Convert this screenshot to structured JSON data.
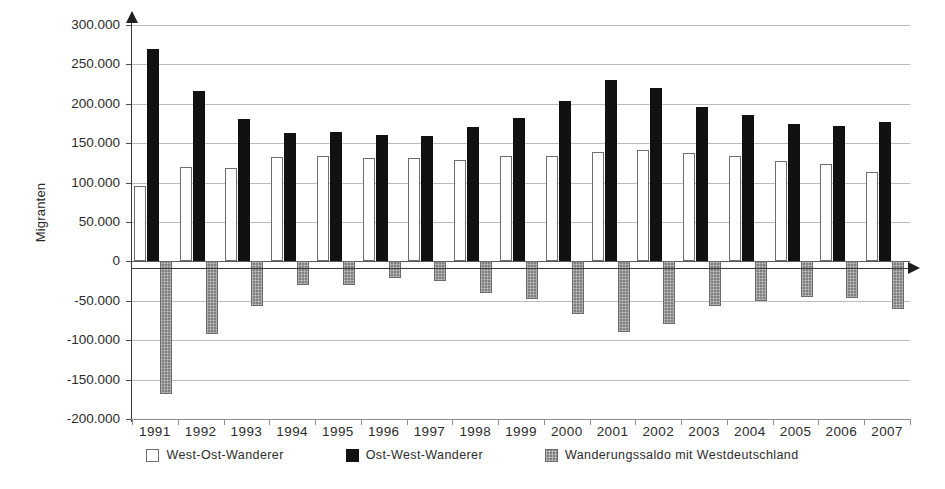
{
  "chart_data": {
    "type": "bar",
    "title": "",
    "xlabel": "",
    "ylabel": "Migranten",
    "ylim": [
      -200000,
      300000
    ],
    "ytick_step": 50000,
    "grid": true,
    "legend_position": "bottom",
    "categories": [
      "1991",
      "1992",
      "1993",
      "1994",
      "1995",
      "1996",
      "1997",
      "1998",
      "1999",
      "2000",
      "2001",
      "2002",
      "2003",
      "2004",
      "2005",
      "2006",
      "2007"
    ],
    "ytick_labels": [
      "300.000",
      "250.000",
      "200.000",
      "150.000",
      "100.000",
      "50.000",
      "0",
      "-50.000",
      "-100.000",
      "-150.000",
      "-200.000"
    ],
    "ytick_values": [
      300000,
      250000,
      200000,
      150000,
      100000,
      50000,
      0,
      -50000,
      -100000,
      -150000,
      -200000
    ],
    "series": [
      {
        "name": "West-Ost-Wanderer",
        "color": "#ffffff",
        "edge_color": "#6e6e6e",
        "values": [
          96000,
          120000,
          119000,
          133000,
          134000,
          131000,
          131000,
          129000,
          134000,
          134000,
          139000,
          141000,
          138000,
          134000,
          127000,
          124000,
          114000
        ]
      },
      {
        "name": "Ost-West-Wanderer",
        "color": "#111111",
        "edge_color": "#111111",
        "values": [
          270000,
          216000,
          181000,
          163000,
          164000,
          160000,
          159000,
          171000,
          182000,
          204000,
          230000,
          220000,
          196000,
          186000,
          174000,
          172000,
          177000
        ]
      },
      {
        "name": "Wanderungssaldo mit Westdeutschland",
        "color": "#808080",
        "edge_color": "#6a6a6a",
        "values": [
          -168000,
          -92000,
          -57000,
          -30000,
          -30000,
          -21000,
          -25000,
          -40000,
          -48000,
          -67000,
          -89000,
          -79000,
          -56000,
          -50000,
          -45000,
          -47000,
          -61000
        ]
      }
    ]
  },
  "axis": {
    "y_title": "Migranten"
  },
  "legend": {
    "items": [
      {
        "label": "West-Ost-Wanderer",
        "swatch": "west-ost"
      },
      {
        "label": "Ost-West-Wanderer",
        "swatch": "ost-west"
      },
      {
        "label": "Wanderungssaldo mit Westdeutschland",
        "swatch": "saldo"
      }
    ]
  },
  "colors": {
    "west_ost": "#ffffff",
    "ost_west": "#111111",
    "saldo": "#808080",
    "grid": "#bcbcbc",
    "axis": "#3a3a3a",
    "text": "#2b2b2b"
  }
}
